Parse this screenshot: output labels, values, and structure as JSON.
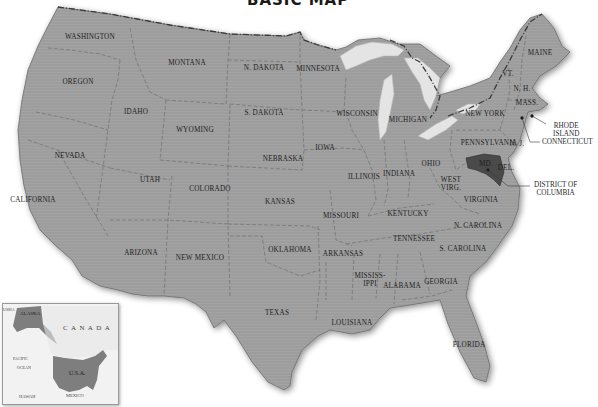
{
  "title": "BASIC MAP",
  "map": {
    "land_color": "#9e9e9e",
    "border_color": "#5a5a5a",
    "water_color": "#e6e6e6",
    "background": "#ffffff",
    "highlight_color": "#555555"
  },
  "states": [
    {
      "key": "washington",
      "label": "WASHINGTON",
      "x": 90,
      "y": 37
    },
    {
      "key": "oregon",
      "label": "OREGON",
      "x": 78,
      "y": 82
    },
    {
      "key": "idaho",
      "label": "IDAHO",
      "x": 136,
      "y": 112
    },
    {
      "key": "montana",
      "label": "MONTANA",
      "x": 187,
      "y": 63
    },
    {
      "key": "wyoming",
      "label": "WYOMING",
      "x": 195,
      "y": 130
    },
    {
      "key": "north-dakota",
      "label": "N. DAKOTA",
      "x": 264,
      "y": 68
    },
    {
      "key": "south-dakota",
      "label": "S. DAKOTA",
      "x": 264,
      "y": 113
    },
    {
      "key": "minnesota",
      "label": "MINNESOTA",
      "x": 318,
      "y": 69
    },
    {
      "key": "wisconsin",
      "label": "WISCONSIN",
      "x": 357,
      "y": 114
    },
    {
      "key": "michigan",
      "label": "MICHIGAN",
      "x": 408,
      "y": 120
    },
    {
      "key": "nevada",
      "label": "NEVADA",
      "x": 70,
      "y": 156
    },
    {
      "key": "utah",
      "label": "UTAH",
      "x": 150,
      "y": 180
    },
    {
      "key": "colorado",
      "label": "COLORADO",
      "x": 210,
      "y": 189
    },
    {
      "key": "nebraska",
      "label": "NEBRASKA",
      "x": 283,
      "y": 159
    },
    {
      "key": "iowa",
      "label": "IOWA",
      "x": 325,
      "y": 148
    },
    {
      "key": "illinois",
      "label": "ILLINOIS",
      "x": 364,
      "y": 177
    },
    {
      "key": "indiana",
      "label": "INDIANA",
      "x": 399,
      "y": 174
    },
    {
      "key": "ohio",
      "label": "OHIO",
      "x": 431,
      "y": 164
    },
    {
      "key": "california",
      "label": "CALIFORNIA",
      "x": 33,
      "y": 200
    },
    {
      "key": "kansas",
      "label": "KANSAS",
      "x": 280,
      "y": 202
    },
    {
      "key": "missouri",
      "label": "MISSOURI",
      "x": 341,
      "y": 216
    },
    {
      "key": "kentucky",
      "label": "KENTUCKY",
      "x": 408,
      "y": 214
    },
    {
      "key": "west-virginia",
      "label": "WEST\nVIRG.",
      "x": 451,
      "y": 184
    },
    {
      "key": "virginia",
      "label": "VIRGINIA",
      "x": 481,
      "y": 200
    },
    {
      "key": "arizona",
      "label": "ARIZONA",
      "x": 141,
      "y": 253
    },
    {
      "key": "new-mexico",
      "label": "NEW MEXICO",
      "x": 200,
      "y": 258
    },
    {
      "key": "oklahoma",
      "label": "OKLAHOMA",
      "x": 290,
      "y": 250
    },
    {
      "key": "arkansas",
      "label": "ARKANSAS",
      "x": 343,
      "y": 254
    },
    {
      "key": "tennessee",
      "label": "TENNESSEE",
      "x": 414,
      "y": 239
    },
    {
      "key": "north-carolina",
      "label": "N. CAROLINA",
      "x": 478,
      "y": 226
    },
    {
      "key": "south-carolina",
      "label": "S. CAROLINA",
      "x": 463,
      "y": 249
    },
    {
      "key": "mississippi",
      "label": "MISSISS-\nIPPI",
      "x": 370,
      "y": 280
    },
    {
      "key": "alabama",
      "label": "ALABAMA",
      "x": 402,
      "y": 286
    },
    {
      "key": "georgia",
      "label": "GEORGIA",
      "x": 441,
      "y": 282
    },
    {
      "key": "texas",
      "label": "TEXAS",
      "x": 277,
      "y": 313
    },
    {
      "key": "louisiana",
      "label": "LOUISIANA",
      "x": 352,
      "y": 323
    },
    {
      "key": "florida",
      "label": "FLORIDA",
      "x": 469,
      "y": 345
    },
    {
      "key": "pennsylvania",
      "label": "PENNSYLVANIA",
      "x": 489,
      "y": 143
    },
    {
      "key": "new-york",
      "label": "NEW YORK",
      "x": 485,
      "y": 114
    },
    {
      "key": "new-jersey",
      "label": "N. J.",
      "x": 517,
      "y": 144
    },
    {
      "key": "vermont",
      "label": "VT.",
      "x": 508,
      "y": 74
    },
    {
      "key": "new-hampshire",
      "label": "N. H.",
      "x": 522,
      "y": 89
    },
    {
      "key": "massachusetts",
      "label": "MASS.",
      "x": 527,
      "y": 103
    },
    {
      "key": "maine",
      "label": "MAINE",
      "x": 540,
      "y": 53
    },
    {
      "key": "maryland",
      "label": "MD.",
      "x": 486,
      "y": 164
    },
    {
      "key": "delaware",
      "label": "DEL.",
      "x": 506,
      "y": 168
    }
  ],
  "callouts": [
    {
      "key": "rhode-island",
      "label": "RHODE\nISLAND",
      "x": 553,
      "y": 122
    },
    {
      "key": "connecticut",
      "label": "CONNECTICUT",
      "x": 542,
      "y": 138
    },
    {
      "key": "district-of-columbia",
      "label": "DISTRICT OF\nCOLUMBIA",
      "x": 534,
      "y": 181
    }
  ],
  "inset": {
    "labels": {
      "russia": "USSIA",
      "alaska": "ALASKA",
      "canada": "C A N A D A",
      "usa": "U.S.A.",
      "pacific": "PACIFIC",
      "ocean": "OCEAN",
      "hawaii": "HAWAII",
      "mexico": "MEXICO"
    }
  }
}
